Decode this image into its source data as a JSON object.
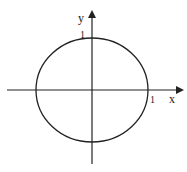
{
  "diagram": {
    "type": "unit-circle-axes",
    "axes": {
      "x_label": "x",
      "y_label": "y"
    },
    "ticks": {
      "x_tick": "1",
      "y_tick": "1"
    },
    "colors": {
      "stroke": "#222222",
      "background": "#ffffff"
    }
  }
}
